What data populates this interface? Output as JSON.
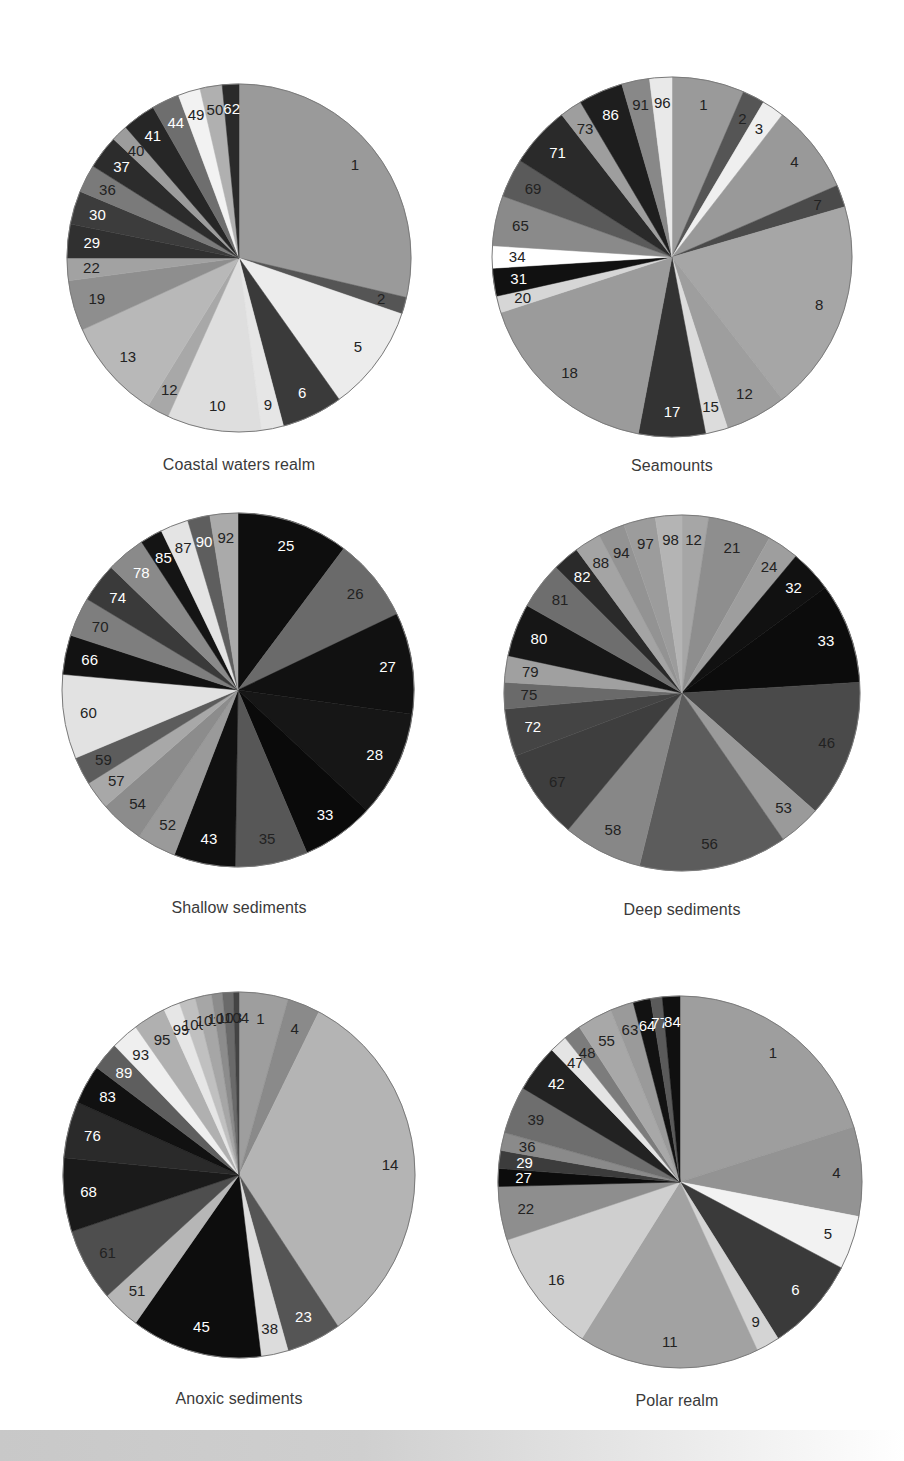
{
  "chart_data": [
    {
      "type": "pie",
      "title": "Coastal waters realm",
      "center": [
        239,
        258
      ],
      "radius": [
        172,
        174
      ],
      "categories": [
        "1",
        "2",
        "5",
        "6",
        "9",
        "10",
        "12",
        "13",
        "19",
        "22",
        "29",
        "30",
        "36",
        "37",
        "40",
        "41",
        "44",
        "49",
        "50",
        "62"
      ],
      "values": [
        27.5,
        1.5,
        9.5,
        5.5,
        2.0,
        8.5,
        2.0,
        9.0,
        4.5,
        2.0,
        3.0,
        3.0,
        2.5,
        3.0,
        1.5,
        3.0,
        2.5,
        2.0,
        2.0,
        1.5
      ],
      "colors": [
        "#9a9a9a",
        "#555555",
        "#ececec",
        "#3a3a3a",
        "#e6e6e6",
        "#dedede",
        "#a8a8a8",
        "#b8b8b8",
        "#8e8e8e",
        "#a2a2a2",
        "#303030",
        "#3c3c3c",
        "#7a7a7a",
        "#2c2c2c",
        "#9c9c9c",
        "#262626",
        "#6e6e6e",
        "#f2f2f2",
        "#b0b0b0",
        "#2a2a2a"
      ],
      "label_colors": [
        "#222",
        "#222",
        "#222",
        "#fff",
        "#222",
        "#222",
        "#222",
        "#222",
        "#222",
        "#222",
        "#fff",
        "#fff",
        "#222",
        "#fff",
        "#222",
        "#fff",
        "#fff",
        "#222",
        "#222",
        "#fff"
      ],
      "unit": "percent of records"
    },
    {
      "type": "pie",
      "title": "Seamounts",
      "center": [
        672,
        257
      ],
      "radius": [
        180,
        180
      ],
      "categories": [
        "1",
        "2",
        "3",
        "4",
        "7",
        "8",
        "12",
        "15",
        "17",
        "18",
        "20",
        "31",
        "34",
        "65",
        "69",
        "71",
        "73",
        "86",
        "91",
        "96"
      ],
      "values": [
        6.5,
        2.0,
        2.0,
        8.0,
        2.0,
        19.0,
        5.5,
        2.0,
        6.0,
        17.0,
        1.5,
        2.5,
        2.0,
        4.5,
        3.5,
        5.5,
        2.0,
        4.0,
        2.5,
        2.0
      ],
      "colors": [
        "#9a9a9a",
        "#555555",
        "#efefef",
        "#999999",
        "#4a4a4a",
        "#a6a6a6",
        "#9e9e9e",
        "#dcdcdc",
        "#333333",
        "#9b9b9b",
        "#d6d6d6",
        "#111111",
        "#ffffff",
        "#8a8a8a",
        "#5a5a5a",
        "#2a2a2a",
        "#9e9e9e",
        "#1e1e1e",
        "#888888",
        "#e9e9e9"
      ],
      "label_colors": [
        "#222",
        "#222",
        "#222",
        "#222",
        "#222",
        "#222",
        "#222",
        "#222",
        "#fff",
        "#222",
        "#222",
        "#fff",
        "#222",
        "#222",
        "#222",
        "#fff",
        "#222",
        "#fff",
        "#222",
        "#222"
      ],
      "unit": "percent of records"
    },
    {
      "type": "pie",
      "title": "Shallow sediments",
      "center": [
        238,
        690
      ],
      "radius": [
        176,
        177
      ],
      "categories": [
        "25",
        "26",
        "27",
        "28",
        "33",
        "35",
        "43",
        "52",
        "54",
        "57",
        "59",
        "60",
        "66",
        "70",
        "74",
        "78",
        "85",
        "87",
        "90",
        "92"
      ],
      "values": [
        10.0,
        7.5,
        9.0,
        9.5,
        6.5,
        6.5,
        5.5,
        3.5,
        4.0,
        2.5,
        2.5,
        7.5,
        3.5,
        3.5,
        3.5,
        3.5,
        2.0,
        2.5,
        2.0,
        2.5
      ],
      "colors": [
        "#0e0e0e",
        "#6a6a6a",
        "#111111",
        "#161616",
        "#0a0a0a",
        "#575757",
        "#101010",
        "#9a9a9a",
        "#8c8c8c",
        "#a8a8a8",
        "#5c5c5c",
        "#e2e2e2",
        "#121212",
        "#7e7e7e",
        "#3a3a3a",
        "#8a8a8a",
        "#141414",
        "#e4e4e4",
        "#5e5e5e",
        "#aaaaaa"
      ],
      "label_colors": [
        "#fff",
        "#222",
        "#fff",
        "#fff",
        "#fff",
        "#222",
        "#fff",
        "#222",
        "#222",
        "#222",
        "#222",
        "#222",
        "#fff",
        "#222",
        "#fff",
        "#fff",
        "#fff",
        "#222",
        "#fff",
        "#222"
      ],
      "unit": "percent of records"
    },
    {
      "type": "pie",
      "title": "Deep sediments",
      "center": [
        682,
        693
      ],
      "radius": [
        178,
        178
      ],
      "categories": [
        "12",
        "21",
        "24",
        "32",
        "33",
        "46",
        "53",
        "56",
        "58",
        "67",
        "72",
        "75",
        "79",
        "80",
        "81",
        "82",
        "88",
        "94",
        "97",
        "98"
      ],
      "values": [
        2.5,
        6.0,
        3.0,
        4.0,
        9.5,
        13.0,
        4.0,
        14.0,
        7.5,
        8.5,
        4.5,
        2.5,
        2.5,
        5.0,
        4.5,
        2.5,
        2.5,
        2.5,
        3.0,
        2.5
      ],
      "colors": [
        "#a6a6a6",
        "#8e8e8e",
        "#9e9e9e",
        "#111111",
        "#0c0c0c",
        "#4a4a4a",
        "#9a9a9a",
        "#5c5c5c",
        "#878787",
        "#3e3e3e",
        "#444444",
        "#6a6a6a",
        "#a0a0a0",
        "#161616",
        "#6e6e6e",
        "#2a2a2a",
        "#a4a4a4",
        "#939393",
        "#9c9c9c",
        "#b4b4b4"
      ],
      "label_colors": [
        "#222",
        "#222",
        "#222",
        "#fff",
        "#fff",
        "#222",
        "#222",
        "#222",
        "#222",
        "#222",
        "#fff",
        "#222",
        "#222",
        "#fff",
        "#222",
        "#fff",
        "#222",
        "#222",
        "#222",
        "#222"
      ],
      "unit": "percent of records"
    },
    {
      "type": "pie",
      "title": "Anoxic sediments",
      "center": [
        239,
        1175
      ],
      "radius": [
        176,
        183
      ],
      "categories": [
        "1",
        "4",
        "14",
        "23",
        "38",
        "45",
        "51",
        "61",
        "68",
        "76",
        "83",
        "89",
        "93",
        "95",
        "99",
        "100",
        "101",
        "102",
        "103",
        "104"
      ],
      "values": [
        4.5,
        3.0,
        33.0,
        5.0,
        2.5,
        12.0,
        3.5,
        6.5,
        6.5,
        5.0,
        3.5,
        2.5,
        2.5,
        3.0,
        1.5,
        1.5,
        1.5,
        1.0,
        1.0,
        0.5
      ],
      "colors": [
        "#9e9e9e",
        "#8a8a8a",
        "#b4b4b4",
        "#555555",
        "#dcdcdc",
        "#0d0d0d",
        "#b6b6b6",
        "#4e4e4e",
        "#1a1a1a",
        "#2a2a2a",
        "#111111",
        "#5e5e5e",
        "#efefef",
        "#b0b0b0",
        "#e6e6e6",
        "#c0c0c0",
        "#a6a6a6",
        "#8c8c8c",
        "#6a6a6a",
        "#444444"
      ],
      "label_colors": [
        "#222",
        "#222",
        "#222",
        "#fff",
        "#222",
        "#fff",
        "#222",
        "#222",
        "#fff",
        "#fff",
        "#fff",
        "#fff",
        "#222",
        "#222",
        "#222",
        "#222",
        "#222",
        "#222",
        "#222",
        "#222"
      ],
      "unit": "percent of records"
    },
    {
      "type": "pie",
      "title": "Polar realm",
      "center": [
        680,
        1182
      ],
      "radius": [
        182,
        186
      ],
      "categories": [
        "1",
        "4",
        "5",
        "6",
        "9",
        "11",
        "16",
        "22",
        "27",
        "29",
        "36",
        "39",
        "42",
        "47",
        "48",
        "55",
        "63",
        "64",
        "77",
        "84"
      ],
      "values": [
        19.5,
        7.5,
        4.5,
        8.0,
        2.0,
        15.5,
        10.5,
        4.5,
        1.5,
        1.5,
        1.5,
        4.0,
        4.0,
        1.5,
        1.5,
        3.0,
        2.0,
        1.5,
        1.0,
        1.5
      ],
      "colors": [
        "#9e9e9e",
        "#939393",
        "#f2f2f2",
        "#3a3a3a",
        "#d4d4d4",
        "#a2a2a2",
        "#cfcfcf",
        "#8e8e8e",
        "#0c0c0c",
        "#3c3c3c",
        "#8a8a8a",
        "#6e6e6e",
        "#222222",
        "#e4e4e4",
        "#7c7c7c",
        "#a8a8a8",
        "#9a9a9a",
        "#121212",
        "#5a5a5a",
        "#101010"
      ],
      "label_colors": [
        "#222",
        "#222",
        "#222",
        "#fff",
        "#222",
        "#222",
        "#222",
        "#222",
        "#fff",
        "#fff",
        "#222",
        "#222",
        "#fff",
        "#222",
        "#222",
        "#222",
        "#222",
        "#fff",
        "#fff",
        "#fff"
      ],
      "unit": "percent of records"
    }
  ],
  "titles": {
    "coastal": "Coastal waters realm",
    "seamounts": "Seamounts",
    "shallow": "Shallow sediments",
    "deep": "Deep sediments",
    "anoxic": "Anoxic sediments",
    "polar": "Polar realm"
  }
}
